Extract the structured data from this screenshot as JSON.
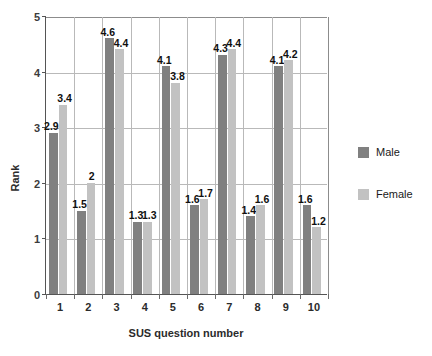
{
  "chart_data": {
    "type": "bar",
    "title": "",
    "xlabel": "SUS question number",
    "ylabel": "Rank",
    "categories": [
      "1",
      "2",
      "3",
      "4",
      "5",
      "6",
      "7",
      "8",
      "9",
      "10"
    ],
    "series": [
      {
        "name": "Male",
        "color": "#808080",
        "values": [
          2.9,
          1.5,
          4.6,
          1.3,
          4.1,
          1.6,
          4.3,
          1.4,
          4.1,
          1.6
        ],
        "labels": [
          "2.9",
          "1.5",
          "4.6",
          "1.3",
          "4.1",
          "1.6",
          "4.3",
          "1.4",
          "4.1",
          "1.6"
        ]
      },
      {
        "name": "Female",
        "color": "#c2c2c2",
        "values": [
          3.4,
          2.0,
          4.4,
          1.3,
          3.8,
          1.7,
          4.4,
          1.6,
          4.2,
          1.2
        ],
        "labels": [
          "3.4",
          "2",
          "4.4",
          "1.3",
          "3.8",
          "1.7",
          "4.4",
          "1.6",
          "4.2",
          "1.2"
        ]
      }
    ],
    "ylim": [
      0,
      5
    ],
    "yticks": [
      "0",
      "1",
      "2",
      "3",
      "4",
      "5"
    ],
    "grid": true,
    "legend_position": "right"
  },
  "legend": {
    "items": [
      {
        "label": "Male"
      },
      {
        "label": "Female"
      }
    ]
  },
  "axes": {
    "y_title": "Rank",
    "x_title": "SUS question number"
  }
}
